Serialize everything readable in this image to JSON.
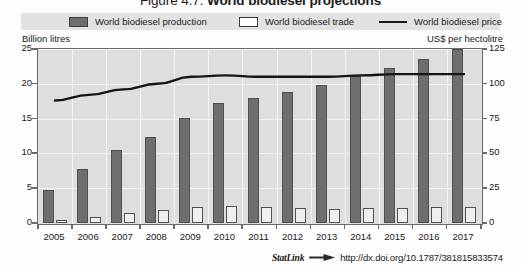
{
  "figure": {
    "number": "Figure 4.7.",
    "title": "World biodiesel projections",
    "full_title": "Figure 4.7.  World biodiesel projections"
  },
  "legend": {
    "position": "top",
    "items": [
      {
        "label": "World biodiesel production",
        "marker": "filled-square",
        "color": "#6e6e6e"
      },
      {
        "label": "World biodiesel trade",
        "marker": "open-square",
        "color": "#ffffff"
      },
      {
        "label": "World biodiesel price",
        "marker": "line",
        "color": "#151515"
      }
    ]
  },
  "axes": {
    "left_caption": "Billion litres",
    "right_caption": "US$ per hectolitre",
    "left_ticks": [
      "0",
      "5",
      "10",
      "15",
      "20",
      "25"
    ],
    "right_ticks": [
      "0",
      "25",
      "50",
      "75",
      "100",
      "125"
    ]
  },
  "statlink": {
    "label": "StatLink",
    "icon": "statlink-arrow-icon",
    "url": "http://dx.doi.org/10.1787/381815833574"
  },
  "chart_data": {
    "type": "bar",
    "title": "World biodiesel projections",
    "xlabel": "",
    "ylabel": "Billion litres",
    "y2label": "US$ per hectolitre",
    "ylim": [
      0,
      25
    ],
    "y2lim": [
      0,
      125
    ],
    "grid": true,
    "legend_position": "top",
    "categories": [
      "2005",
      "2006",
      "2007",
      "2008",
      "2009",
      "2010",
      "2011",
      "2012",
      "2013",
      "2014",
      "2015",
      "2016",
      "2017"
    ],
    "series": [
      {
        "name": "World biodiesel production",
        "type": "bar",
        "axis": "left",
        "unit": "Billion litres",
        "color": "#6e6e6e",
        "values": [
          4.8,
          7.7,
          10.5,
          12.4,
          15.1,
          17.3,
          18.0,
          18.8,
          19.8,
          21.1,
          22.2,
          23.6,
          25.0
        ]
      },
      {
        "name": "World biodiesel trade",
        "type": "bar",
        "axis": "left",
        "unit": "Billion litres",
        "color": "#ffffff",
        "values": [
          0.4,
          0.9,
          1.5,
          1.8,
          2.3,
          2.4,
          2.3,
          2.1,
          2.0,
          2.1,
          2.2,
          2.3,
          2.3
        ]
      },
      {
        "name": "World biodiesel price",
        "type": "line",
        "axis": "right",
        "unit": "US$ per hectolitre",
        "color": "#151515",
        "values": [
          88,
          92,
          96,
          100,
          105,
          106,
          105,
          105,
          105,
          106,
          107,
          107,
          107
        ]
      }
    ]
  }
}
